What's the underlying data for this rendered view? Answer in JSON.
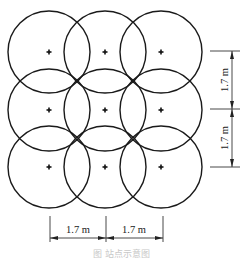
{
  "figure": {
    "caption": "图   站点示意图",
    "grid": {
      "rows": 3,
      "cols": 3
    },
    "circles": [
      {
        "cx": 49,
        "cy": 52
      },
      {
        "cx": 105,
        "cy": 52
      },
      {
        "cx": 161,
        "cy": 52
      },
      {
        "cx": 49,
        "cy": 110
      },
      {
        "cx": 105,
        "cy": 110
      },
      {
        "cx": 161,
        "cy": 110
      },
      {
        "cx": 49,
        "cy": 167
      },
      {
        "cx": 105,
        "cy": 167
      },
      {
        "cx": 161,
        "cy": 167
      }
    ],
    "radius": 41,
    "dimensions": {
      "horizontal": [
        {
          "label": "1.7 m",
          "x1": 50,
          "x2": 106,
          "y": 238
        },
        {
          "label": "1.7 m",
          "x1": 106,
          "x2": 163,
          "y": 238
        }
      ],
      "vertical": [
        {
          "label": "1.7 m",
          "y1": 51,
          "y2": 109,
          "x": 232
        },
        {
          "label": "1.7 m",
          "y1": 109,
          "y2": 167,
          "x": 232
        }
      ]
    },
    "colors": {
      "stroke": "#1a1a1a",
      "caption": "#c8c8c8"
    }
  }
}
